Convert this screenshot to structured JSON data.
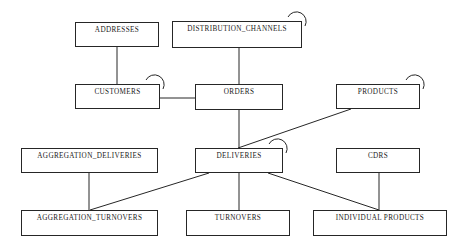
{
  "diagram": {
    "type": "entity-relationship-schema",
    "background_color": "#ffffff",
    "line_color": "#262626",
    "text_color": "#1a1a1a",
    "canvas": {
      "width": 469,
      "height": 252
    },
    "entities": [
      {
        "id": "addresses",
        "label": "ADDRESSES",
        "x": 75,
        "y": 22,
        "w": 84,
        "h": 25,
        "self_loop": false
      },
      {
        "id": "distribution_channels",
        "label": "DISTRIBUTION_CHANNELS",
        "x": 172,
        "y": 21,
        "w": 130,
        "h": 27,
        "self_loop": true
      },
      {
        "id": "customers",
        "label": "CUSTOMERS",
        "x": 75,
        "y": 84,
        "w": 85,
        "h": 25,
        "self_loop": true
      },
      {
        "id": "orders",
        "label": "ORDERS",
        "x": 195,
        "y": 84,
        "w": 88,
        "h": 26,
        "self_loop": false
      },
      {
        "id": "products",
        "label": "PRODUCTS",
        "x": 336,
        "y": 84,
        "w": 84,
        "h": 25,
        "self_loop": true
      },
      {
        "id": "aggregation_deliveries",
        "label": "AGGREGATION_DELIVERIES",
        "x": 21,
        "y": 148,
        "w": 137,
        "h": 25,
        "self_loop": false
      },
      {
        "id": "deliveries",
        "label": "DELIVERIES",
        "x": 195,
        "y": 148,
        "w": 88,
        "h": 25,
        "self_loop": true
      },
      {
        "id": "cdrs",
        "label": "CDRS",
        "x": 336,
        "y": 148,
        "w": 84,
        "h": 25,
        "self_loop": false
      },
      {
        "id": "aggregation_turnovers",
        "label": "AGGREGATION_TURNOVERS",
        "x": 21,
        "y": 210,
        "w": 137,
        "h": 26,
        "self_loop": false
      },
      {
        "id": "turnovers",
        "label": "TURNOVERS",
        "x": 186,
        "y": 210,
        "w": 104,
        "h": 26,
        "self_loop": false
      },
      {
        "id": "individual_products",
        "label": "INDIVIDUAL PRODUCTS",
        "x": 313,
        "y": 210,
        "w": 134,
        "h": 26,
        "self_loop": false
      }
    ],
    "relationships": [
      {
        "id": "addresses-customers",
        "from": "addresses",
        "to": "customers",
        "points": "117,47 117,84"
      },
      {
        "id": "distribution_channels-orders",
        "from": "distribution_channels",
        "to": "orders",
        "points": "239,48 239,84"
      },
      {
        "id": "customers-orders",
        "from": "customers",
        "to": "orders",
        "points": "160,98 195,98"
      },
      {
        "id": "orders-deliveries",
        "from": "orders",
        "to": "deliveries",
        "points": "239,110 239,148"
      },
      {
        "id": "products-deliveries",
        "from": "products",
        "to": "deliveries",
        "points": "351,109 238,148"
      },
      {
        "id": "aggregation_deliveries-aggregation_turnovers",
        "from": "aggregation_deliveries",
        "to": "aggregation_turnovers",
        "points": "89,173 89,210"
      },
      {
        "id": "deliveries-aggregation_turnovers",
        "from": "deliveries",
        "to": "aggregation_turnovers",
        "points": "209,173 90,210"
      },
      {
        "id": "deliveries-turnovers",
        "from": "deliveries",
        "to": "turnovers",
        "points": "239,173 239,210"
      },
      {
        "id": "deliveries-individual_products",
        "from": "deliveries",
        "to": "individual_products",
        "points": "268,173 379,210"
      },
      {
        "id": "cdrs-individual_products",
        "from": "cdrs",
        "to": "individual_products",
        "points": "379,173 379,210"
      }
    ],
    "self_loops": [
      {
        "id": "loop-distribution_channels",
        "entity": "distribution_channels",
        "cx": 297,
        "cy": 15,
        "r": 9
      },
      {
        "id": "loop-customers",
        "entity": "customers",
        "cx": 155,
        "cy": 78,
        "r": 9
      },
      {
        "id": "loop-products",
        "entity": "products",
        "cx": 415,
        "cy": 78,
        "r": 9
      },
      {
        "id": "loop-deliveries",
        "entity": "deliveries",
        "cx": 278,
        "cy": 142,
        "r": 9
      }
    ]
  }
}
